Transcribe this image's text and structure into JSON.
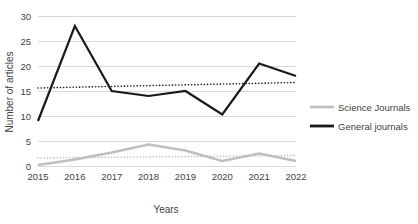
{
  "chart_data": {
    "type": "line",
    "title": "",
    "xlabel": "Years",
    "ylabel": "Number of articles",
    "categories": [
      "2015",
      "2016",
      "2017",
      "2018",
      "2019",
      "2020",
      "2021",
      "2022"
    ],
    "ylim": [
      0,
      30
    ],
    "yticks": [
      "0",
      "5",
      "10",
      "15",
      "20",
      "25",
      "30"
    ],
    "grid": true,
    "legend_position": "right",
    "series": [
      {
        "name": "Science Journals",
        "color": "#bfbfbf",
        "values": [
          0.2,
          1.3,
          2.7,
          4.3,
          3.1,
          1.0,
          2.5,
          1.0
        ],
        "trendline": {
          "start": 1.6,
          "end": 2.1,
          "style": "dotted",
          "color": "#bfbfbf"
        }
      },
      {
        "name": "General journals",
        "color": "#1a1a1a",
        "values": [
          9,
          28,
          15,
          14,
          15,
          10.3,
          20.5,
          18
        ],
        "trendline": {
          "start": 15.6,
          "end": 16.7,
          "style": "dotted",
          "color": "#1a1a1a"
        }
      }
    ]
  },
  "legend": {
    "items": [
      {
        "label": "Science Journals",
        "color": "#bfbfbf"
      },
      {
        "label": "General journals",
        "color": "#1a1a1a"
      }
    ]
  },
  "axes": {
    "y_title": "Number of articles",
    "x_title": "Years"
  }
}
